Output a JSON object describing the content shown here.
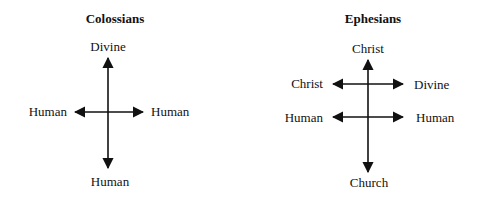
{
  "diagrams": [
    {
      "title": "Colossians",
      "labels": {
        "top": "Divine",
        "left": "Human",
        "right": "Human",
        "bottom": "Human"
      }
    },
    {
      "title": "Ephesians",
      "labels": {
        "top": "Christ",
        "upper_left": "Christ",
        "upper_right": "Divine",
        "lower_left": "Human",
        "lower_right": "Human",
        "bottom": "Church"
      }
    }
  ],
  "colors": {
    "ink": "#111111",
    "background": "#ffffff"
  }
}
